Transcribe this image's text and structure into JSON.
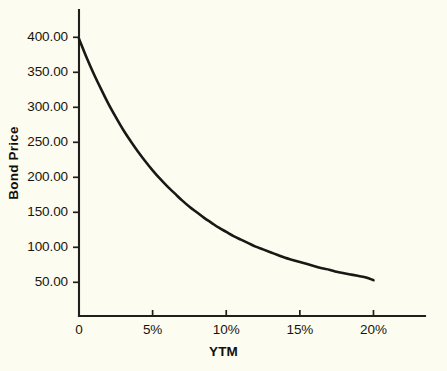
{
  "chart_data": {
    "type": "line",
    "title": "",
    "subtitle": "",
    "xlabel": "YTM",
    "ylabel": "Bond Price",
    "xlim": [
      0,
      23.5
    ],
    "ylim": [
      0,
      425
    ],
    "grid": false,
    "legend": null,
    "x_tick_labels": [
      "0",
      "5%",
      "10%",
      "15%",
      "20%"
    ],
    "x_tick_values": [
      0,
      5,
      10,
      15,
      20
    ],
    "y_tick_labels": [
      "400.00",
      "350.00",
      "300.00",
      "250.00",
      "200.00",
      "150.00",
      "100.00",
      "50.00"
    ],
    "y_tick_values": [
      400,
      350,
      300,
      250,
      200,
      150,
      100,
      50
    ],
    "series": [
      {
        "name": "Bond Price",
        "color": "#1a1815",
        "x": [
          0,
          0.5,
          1,
          1.5,
          2,
          2.5,
          3,
          3.5,
          4,
          4.5,
          5,
          5.5,
          6,
          6.5,
          7,
          7.5,
          8,
          8.5,
          9,
          9.5,
          10,
          10.5,
          11,
          11.5,
          12,
          12.5,
          13,
          13.5,
          14,
          14.5,
          15,
          15.5,
          16,
          16.5,
          17,
          17.5,
          18,
          18.5,
          19,
          19.5,
          20
        ],
        "values": [
          398,
          372,
          348,
          326,
          305,
          286,
          268,
          252,
          237,
          223,
          210,
          198,
          187,
          177,
          167,
          158,
          150,
          142,
          135,
          128,
          122,
          116,
          111,
          106,
          101,
          97,
          93,
          89,
          85,
          82,
          79,
          76,
          73,
          70,
          68,
          65,
          63,
          61,
          59,
          57,
          53
        ]
      }
    ],
    "annotations": []
  },
  "colors": {
    "background": "#fdfcf0",
    "axis": "#211f1c",
    "curve": "#1a1815",
    "text": "#17150f"
  }
}
